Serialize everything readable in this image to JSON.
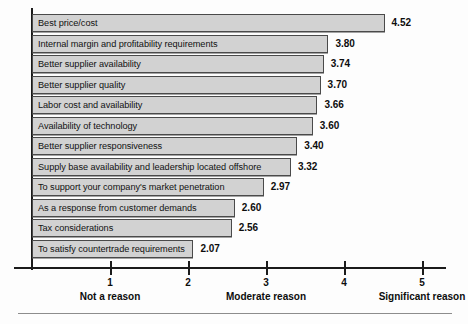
{
  "chart_data": {
    "type": "bar",
    "orientation": "horizontal",
    "title": "",
    "xlabel": "",
    "ylabel": "",
    "xlim": [
      0,
      5.5
    ],
    "grid": false,
    "legend": "none",
    "categories": [
      "Best price/cost",
      "Internal margin and profitability requirements",
      "Better supplier availability",
      "Better supplier quality",
      "Labor cost and availability",
      "Availability of technology",
      "Better supplier responsiveness",
      "Supply base availability and leadership located offshore",
      "To support your company's market penetration",
      "As a response from customer demands",
      "Tax considerations",
      "To satisfy countertrade requirements"
    ],
    "values": [
      4.52,
      3.8,
      3.74,
      3.7,
      3.66,
      3.6,
      3.4,
      3.32,
      2.97,
      2.6,
      2.56,
      2.07
    ],
    "value_labels": [
      "4.52",
      "3.80",
      "3.74",
      "3.70",
      "3.66",
      "3.60",
      "3.40",
      "3.32",
      "2.97",
      "2.60",
      "2.56",
      "2.07"
    ],
    "bar_fill_color": "#d2d2d2",
    "bar_border_color": "#4a4a4a",
    "axis_color": "#1b1b1b",
    "axis": {
      "ticks": [
        {
          "value": 1,
          "label": "1",
          "caption": "Not a reason"
        },
        {
          "value": 2,
          "label": "2",
          "caption": ""
        },
        {
          "value": 3,
          "label": "3",
          "caption": "Moderate reason"
        },
        {
          "value": 4,
          "label": "4",
          "caption": ""
        },
        {
          "value": 5,
          "label": "5",
          "caption": "Significant reason"
        }
      ]
    }
  }
}
